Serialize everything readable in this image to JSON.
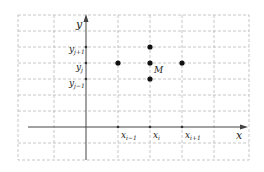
{
  "diagram": {
    "axis_labels": {
      "x": "x",
      "y": "y"
    },
    "x_ticks": [
      {
        "base": "x",
        "sub": "i−1"
      },
      {
        "base": "x",
        "sub": "i"
      },
      {
        "base": "x",
        "sub": "i+1"
      }
    ],
    "y_ticks": [
      {
        "base": "y",
        "sub": "j+1"
      },
      {
        "base": "y",
        "sub": "j"
      },
      {
        "base": "y",
        "sub": "j−1"
      }
    ],
    "center_point_label": "M",
    "points": [
      {
        "name": "left-neighbor",
        "grid": [
          "i-1",
          "j"
        ]
      },
      {
        "name": "top-neighbor",
        "grid": [
          "i",
          "j+1"
        ]
      },
      {
        "name": "center-M",
        "grid": [
          "i",
          "j"
        ]
      },
      {
        "name": "bottom-neighbor",
        "grid": [
          "i",
          "j-1"
        ]
      },
      {
        "name": "right-neighbor",
        "grid": [
          "i+1",
          "j"
        ]
      }
    ],
    "colors": {
      "grid": "#b8b8b8",
      "axis": "#444444",
      "point": "#111111"
    }
  }
}
